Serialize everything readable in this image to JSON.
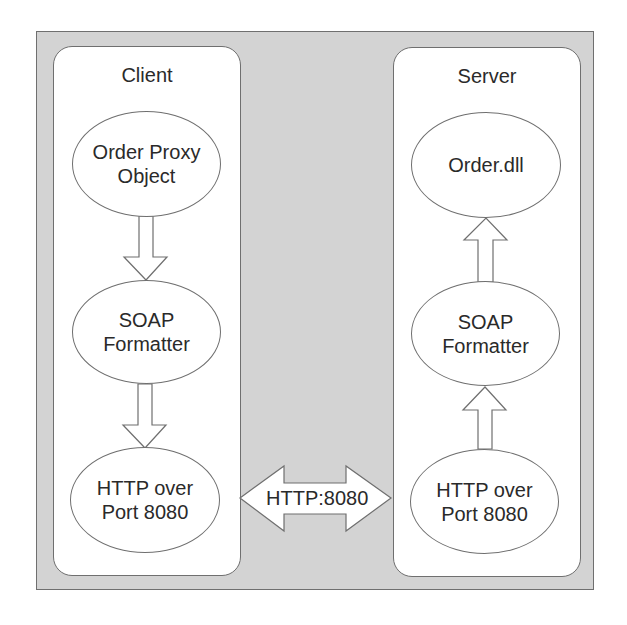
{
  "diagram": {
    "client": {
      "title": "Client",
      "nodes": [
        {
          "id": "order-proxy",
          "label": "Order Proxy\nObject"
        },
        {
          "id": "soap-formatter",
          "label": "SOAP\nFormatter"
        },
        {
          "id": "http-port",
          "label": "HTTP over\nPort 8080"
        }
      ],
      "flow_direction": "down"
    },
    "server": {
      "title": "Server",
      "nodes": [
        {
          "id": "order-dll",
          "label": "Order.dll"
        },
        {
          "id": "soap-formatter",
          "label": "SOAP\nFormatter"
        },
        {
          "id": "http-port",
          "label": "HTTP over\nPort 8080"
        }
      ],
      "flow_direction": "up"
    },
    "link": {
      "label": "HTTP:8080",
      "type": "bidirectional"
    },
    "colors": {
      "background": "#d3d3d3",
      "panel": "#ffffff",
      "stroke": "#6f6f6f"
    }
  }
}
